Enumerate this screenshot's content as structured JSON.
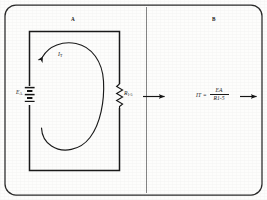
{
  "figure": {
    "panels": [
      {
        "id": "A",
        "label": "A",
        "description": "series circuit with source and total resistance"
      },
      {
        "id": "B",
        "label": "B",
        "description": "equivalent Ohm's law expression"
      }
    ]
  },
  "circuit": {
    "source": {
      "symbol": "battery",
      "label_main": "E",
      "label_sub": "A"
    },
    "resistor": {
      "symbol": "resistor",
      "label_main": "R",
      "label_sub": "1-5"
    },
    "current_loop": {
      "symbol": "current-loop-arrow",
      "direction": "counterclockwise",
      "label_main": "I",
      "label_sub": "T"
    }
  },
  "equation": {
    "lhs_main": "I",
    "lhs_sub": "T",
    "operator": "=",
    "numerator_main": "E",
    "numerator_sub": "A",
    "denominator_main": "R",
    "denominator_sub": "1-5"
  },
  "connectors": {
    "arrow_left_label": "",
    "arrow_right_label": ""
  },
  "colors": {
    "ink": "#1a1a1a",
    "paper": "#fdfdfc",
    "divider": "#6b6b6b"
  }
}
